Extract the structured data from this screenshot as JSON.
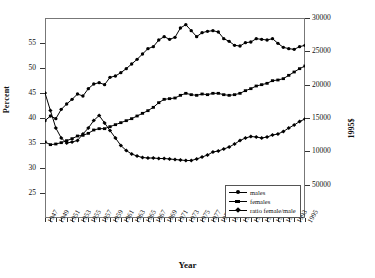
{
  "chart_data": {
    "type": "line",
    "title": "",
    "xlabel": "Year",
    "ylabel": "Percent",
    "ylabel_right": "1995$",
    "grid": false,
    "legend_position": "bottom-right",
    "xlim": [
      1947,
      1995
    ],
    "ylim": [
      20,
      60
    ],
    "ylim_right": [
      0,
      30000
    ],
    "yticks": [
      25,
      30,
      35,
      40,
      45,
      50,
      55
    ],
    "yticks_right": [
      "50000",
      "10000",
      "15000",
      "20000",
      "25000",
      "30000"
    ],
    "yticks_right_values": [
      5000,
      10000,
      15000,
      20000,
      25000,
      30000
    ],
    "x": [
      1947,
      1948,
      1949,
      1950,
      1951,
      1952,
      1953,
      1954,
      1955,
      1956,
      1957,
      1958,
      1959,
      1960,
      1961,
      1962,
      1963,
      1964,
      1965,
      1966,
      1967,
      1968,
      1969,
      1970,
      1971,
      1972,
      1973,
      1974,
      1975,
      1976,
      1977,
      1978,
      1979,
      1980,
      1981,
      1982,
      1983,
      1984,
      1985,
      1986,
      1987,
      1988,
      1989,
      1990,
      1991,
      1992,
      1993,
      1994,
      1995
    ],
    "xticks": [
      1947,
      1949,
      1951,
      1953,
      1955,
      1957,
      1959,
      1961,
      1963,
      1965,
      1967,
      1969,
      1971,
      1973,
      1975,
      1977,
      1979,
      1981,
      1983,
      1985,
      1987,
      1989,
      1991,
      1993,
      1995
    ],
    "xticklabels": [
      "1947",
      "1949",
      "1951",
      "1953",
      "1955",
      "1957",
      "1959",
      "1961",
      "1963",
      "1965",
      "1967",
      "1969",
      "1971",
      "1973",
      "1975",
      "1977",
      "1979",
      "1981",
      "1983",
      "1985",
      "1987",
      "1989",
      "1991",
      "1993",
      "1995"
    ],
    "series": [
      {
        "name": "males",
        "axis": "right",
        "marker": "circle",
        "values": [
          14600,
          15300,
          14900,
          16300,
          17100,
          17800,
          18600,
          18300,
          19400,
          20100,
          20300,
          20000,
          21100,
          21300,
          21800,
          22400,
          23100,
          23800,
          24600,
          25400,
          25700,
          26700,
          27200,
          26800,
          27100,
          28500,
          29000,
          28100,
          27200,
          27800,
          28000,
          28100,
          27900,
          26900,
          26500,
          25900,
          25800,
          26300,
          26400,
          26900,
          26800,
          26700,
          26900,
          26200,
          25600,
          25400,
          25300,
          25700,
          25900
        ]
      },
      {
        "name": "females",
        "axis": "right",
        "marker": "square",
        "values": [
          11400,
          11000,
          11100,
          11300,
          11600,
          11900,
          12300,
          12400,
          12700,
          13200,
          13400,
          13400,
          13700,
          14000,
          14300,
          14600,
          14900,
          15300,
          15700,
          16100,
          16600,
          17300,
          17800,
          17900,
          18000,
          18400,
          18700,
          18500,
          18400,
          18600,
          18500,
          18700,
          18700,
          18500,
          18400,
          18500,
          18700,
          19100,
          19400,
          19800,
          20000,
          20200,
          20600,
          20700,
          20900,
          21400,
          21900,
          22400,
          22800
        ]
      },
      {
        "name": "ratio female/male",
        "axis": "left",
        "marker": "diamond",
        "unit": "percent",
        "values": [
          45.0,
          41.5,
          38.0,
          36.0,
          35.0,
          35.2,
          35.5,
          36.8,
          38.0,
          39.5,
          40.5,
          39.0,
          37.5,
          36.0,
          34.5,
          33.5,
          32.8,
          32.4,
          32.1,
          32.0,
          32.0,
          31.9,
          31.9,
          31.8,
          31.7,
          31.6,
          31.5,
          31.5,
          31.8,
          32.2,
          32.6,
          33.2,
          33.4,
          33.8,
          34.2,
          34.8,
          35.5,
          36.0,
          36.3,
          36.2,
          36.0,
          36.2,
          36.6,
          36.8,
          37.3,
          38.0,
          38.6,
          39.3,
          39.8
        ]
      }
    ]
  },
  "legend": {
    "items": [
      {
        "label": "males",
        "marker": "circle"
      },
      {
        "label": "females",
        "marker": "square"
      },
      {
        "label": "ratio female/male",
        "marker": "diamond"
      }
    ]
  },
  "axes": {
    "x_title": "Year",
    "y_title_left": "Percent",
    "y_title_right": "1995$"
  }
}
